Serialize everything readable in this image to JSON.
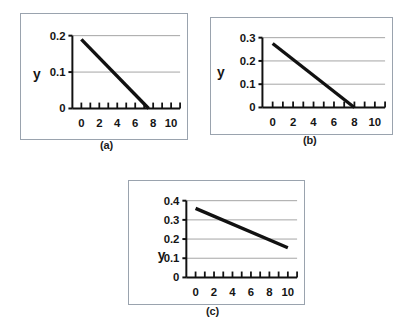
{
  "figure": {
    "background_color": "#ffffff",
    "frame_color": "#9aa3ae",
    "line_color": "#111111",
    "grid_color": "#9a9a9a"
  },
  "captions": {
    "a": "(a)",
    "b": "(b)",
    "c": "(c)"
  },
  "chart_data": [
    {
      "id": "a",
      "type": "line",
      "title": "",
      "caption": "(a)",
      "xlabel": "",
      "ylabel": "y",
      "xlim": [
        -1,
        11
      ],
      "ylim": [
        0,
        0.2
      ],
      "xticks": [
        0,
        2,
        4,
        6,
        8,
        10
      ],
      "xtick_labels": [
        "0",
        "2",
        "4",
        "6",
        "8",
        "10"
      ],
      "x_minor_tick_step": 1,
      "yticks": [
        0,
        0.1,
        0.2
      ],
      "ytick_labels": [
        "0",
        "0.1",
        "0.2"
      ],
      "grid": "horizontal",
      "gridlines_y": [
        0.1,
        0.2
      ],
      "legend": "none",
      "series": [
        {
          "name": "y",
          "x": [
            0,
            7.5
          ],
          "values": [
            0.19,
            0.0
          ]
        }
      ]
    },
    {
      "id": "b",
      "type": "line",
      "title": "",
      "caption": "(b)",
      "xlabel": "",
      "ylabel": "y",
      "xlim": [
        -1,
        11
      ],
      "ylim": [
        0,
        0.3
      ],
      "xticks": [
        0,
        2,
        4,
        6,
        8,
        10
      ],
      "xtick_labels": [
        "0",
        "2",
        "4",
        "6",
        "8",
        "10"
      ],
      "x_minor_tick_step": 1,
      "yticks": [
        0,
        0.1,
        0.2,
        0.3
      ],
      "ytick_labels": [
        "0",
        "0.1",
        "0.2",
        "0.3"
      ],
      "grid": "horizontal",
      "gridlines_y": [
        0.1,
        0.2,
        0.3
      ],
      "legend": "none",
      "series": [
        {
          "name": "y",
          "x": [
            0,
            8.0
          ],
          "values": [
            0.275,
            0.0
          ]
        }
      ]
    },
    {
      "id": "c",
      "type": "line",
      "title": "",
      "caption": "(c)",
      "xlabel": "",
      "ylabel": "y",
      "xlim": [
        -1,
        11
      ],
      "ylim": [
        0,
        0.4
      ],
      "xticks": [
        0,
        2,
        4,
        6,
        8,
        10
      ],
      "xtick_labels": [
        "0",
        "2",
        "4",
        "6",
        "8",
        "10"
      ],
      "x_minor_tick_step": 1,
      "yticks": [
        0,
        0.1,
        0.2,
        0.3,
        0.4
      ],
      "ytick_labels": [
        "0",
        "0.1",
        "0.2",
        "0.3",
        "0.4"
      ],
      "grid": "horizontal",
      "gridlines_y": [
        0.1,
        0.2,
        0.3,
        0.4
      ],
      "legend": "none",
      "series": [
        {
          "name": "y",
          "x": [
            0,
            10.0
          ],
          "values": [
            0.36,
            0.155
          ]
        }
      ]
    }
  ]
}
